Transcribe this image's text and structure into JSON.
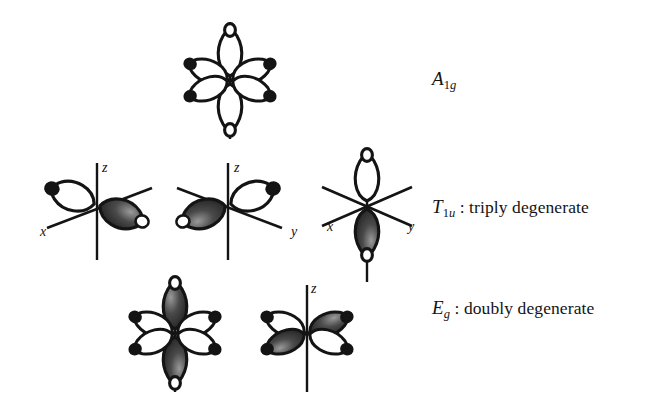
{
  "figure": {
    "background_color": "#ffffff",
    "ink_color": "#141414",
    "lobe_fill_positive": "#ffffff",
    "lobe_fill_negative": "#1c1c1c",
    "width": 668,
    "height": 415
  },
  "rows": [
    {
      "id": "a1g",
      "label_symbol": "A",
      "label_subscript": "1g",
      "label_subscript_plain": "1",
      "label_subscript_italic": "g",
      "label_separator": "",
      "label_description": "",
      "label_full": "A1g",
      "diagram_count": 1,
      "diagrams": [
        {
          "name": "a1g-orbital",
          "axes": [],
          "axis_labels": [],
          "lobes": [
            {
              "direction": "up",
              "sign": "positive"
            },
            {
              "direction": "down",
              "sign": "positive"
            },
            {
              "direction": "upper-left",
              "sign": "positive"
            },
            {
              "direction": "lower-left",
              "sign": "positive"
            },
            {
              "direction": "upper-right",
              "sign": "positive"
            },
            {
              "direction": "lower-right",
              "sign": "positive"
            }
          ]
        }
      ]
    },
    {
      "id": "t1u",
      "label_symbol": "T",
      "label_subscript": "1u",
      "label_subscript_plain": "1",
      "label_subscript_italic": "u",
      "label_separator": " : ",
      "label_description": "triply degenerate",
      "label_full": "T1u : triply degenerate",
      "diagram_count": 3,
      "diagrams": [
        {
          "name": "t1u-x-orbital",
          "axes": [
            "vertical",
            "diagonal-x"
          ],
          "axis_labels": [
            "z",
            "x"
          ],
          "lobes": [
            {
              "direction": "upper-left",
              "sign": "positive"
            },
            {
              "direction": "lower-right",
              "sign": "negative"
            }
          ]
        },
        {
          "name": "t1u-y-orbital",
          "axes": [
            "vertical",
            "diagonal-y"
          ],
          "axis_labels": [
            "z",
            "y"
          ],
          "lobes": [
            {
              "direction": "upper-right",
              "sign": "positive"
            },
            {
              "direction": "lower-left",
              "sign": "negative"
            }
          ]
        },
        {
          "name": "t1u-z-orbital",
          "axes": [
            "vertical",
            "diagonal-x",
            "diagonal-y"
          ],
          "axis_labels": [
            "x",
            "y"
          ],
          "lobes": [
            {
              "direction": "up",
              "sign": "positive"
            },
            {
              "direction": "down",
              "sign": "negative"
            }
          ]
        }
      ]
    },
    {
      "id": "eg",
      "label_symbol": "E",
      "label_subscript": "g",
      "label_subscript_plain": "",
      "label_subscript_italic": "g",
      "label_separator": " : ",
      "label_description": "doubly degenerate",
      "label_full": "Eg : doubly degenerate",
      "diagram_count": 2,
      "diagrams": [
        {
          "name": "eg-z2-orbital",
          "axes": [
            "vertical"
          ],
          "axis_labels": [],
          "lobes": [
            {
              "direction": "up",
              "sign": "negative"
            },
            {
              "direction": "down",
              "sign": "negative"
            },
            {
              "direction": "upper-left",
              "sign": "positive"
            },
            {
              "direction": "lower-left",
              "sign": "positive"
            },
            {
              "direction": "upper-right",
              "sign": "positive"
            },
            {
              "direction": "lower-right",
              "sign": "positive"
            }
          ]
        },
        {
          "name": "eg-x2y2-orbital",
          "axes": [
            "vertical"
          ],
          "axis_labels": [
            "z"
          ],
          "lobes": [
            {
              "direction": "upper-left",
              "sign": "positive"
            },
            {
              "direction": "lower-left",
              "sign": "negative"
            },
            {
              "direction": "upper-right",
              "sign": "negative"
            },
            {
              "direction": "lower-right",
              "sign": "positive"
            }
          ]
        }
      ]
    }
  ],
  "axis_letters": [
    {
      "name": "axis-letter-z-t1u-1",
      "text": "z",
      "x": 102,
      "y": 160
    },
    {
      "name": "axis-letter-x-t1u-1",
      "text": "x",
      "x": 40,
      "y": 224
    },
    {
      "name": "axis-letter-z-t1u-2",
      "text": "z",
      "x": 234,
      "y": 160
    },
    {
      "name": "axis-letter-y-t1u-2",
      "text": "y",
      "x": 291,
      "y": 224
    },
    {
      "name": "axis-letter-x-t1u-3",
      "text": "x",
      "x": 327,
      "y": 219
    },
    {
      "name": "axis-letter-y-t1u-3",
      "text": "y",
      "x": 408,
      "y": 219
    },
    {
      "name": "axis-letter-z-eg-2",
      "text": "z",
      "x": 311,
      "y": 281
    }
  ]
}
